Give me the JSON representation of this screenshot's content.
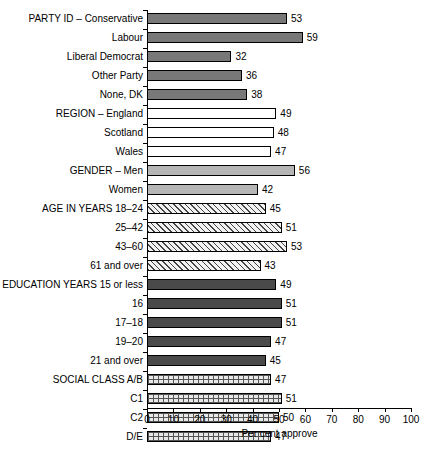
{
  "chart_data": {
    "type": "bar",
    "orientation": "horizontal",
    "title": "",
    "xlabel": "Per cent approve",
    "ylabel": "",
    "xlim": [
      0,
      100
    ],
    "xticks": [
      0,
      10,
      20,
      30,
      40,
      50,
      60,
      70,
      80,
      90,
      100
    ],
    "grid": false,
    "legend": "none",
    "categories": [
      "PARTY ID – Conservative",
      "Labour",
      "Liberal Democrat",
      "Other Party",
      "None, DK",
      "REGION – England",
      "Scotland",
      "Wales",
      "GENDER – Men",
      "Women",
      "AGE IN YEARS 18–24",
      "25–42",
      "43–60",
      "61 and over",
      "EDUCATION YEARS 15 or less",
      "16",
      "17–18",
      "19–20",
      "21 and over",
      "SOCIAL CLASS A/B",
      "C1",
      "C2",
      "D/E"
    ],
    "values": [
      53,
      59,
      32,
      36,
      38,
      49,
      48,
      47,
      56,
      42,
      45,
      51,
      53,
      43,
      49,
      51,
      51,
      47,
      45,
      47,
      51,
      50,
      47
    ],
    "groups": [
      {
        "name": "PARTY ID",
        "fill": "dark",
        "rows": [
          0,
          1,
          2,
          3,
          4
        ]
      },
      {
        "name": "REGION",
        "fill": "white",
        "rows": [
          5,
          6,
          7
        ]
      },
      {
        "name": "GENDER",
        "fill": "light",
        "rows": [
          8,
          9
        ]
      },
      {
        "name": "AGE IN YEARS",
        "fill": "hatch",
        "rows": [
          10,
          11,
          12,
          13
        ]
      },
      {
        "name": "EDUCATION YEARS",
        "fill": "vdark",
        "rows": [
          14,
          15,
          16,
          17,
          18
        ]
      },
      {
        "name": "SOCIAL CLASS",
        "fill": "brick",
        "rows": [
          19,
          20,
          21,
          22
        ]
      }
    ],
    "bars": [
      {
        "label": "PARTY ID – Conservative",
        "value": 53,
        "fill": "dark"
      },
      {
        "label": "Labour",
        "value": 59,
        "fill": "dark"
      },
      {
        "label": "Liberal Democrat",
        "value": 32,
        "fill": "dark"
      },
      {
        "label": "Other Party",
        "value": 36,
        "fill": "dark"
      },
      {
        "label": "None, DK",
        "value": 38,
        "fill": "dark"
      },
      {
        "label": "REGION – England",
        "value": 49,
        "fill": "white"
      },
      {
        "label": "Scotland",
        "value": 48,
        "fill": "white"
      },
      {
        "label": "Wales",
        "value": 47,
        "fill": "white"
      },
      {
        "label": "GENDER – Men",
        "value": 56,
        "fill": "light"
      },
      {
        "label": "Women",
        "value": 42,
        "fill": "light"
      },
      {
        "label": "AGE IN YEARS 18–24",
        "value": 45,
        "fill": "hatch"
      },
      {
        "label": "25–42",
        "value": 51,
        "fill": "hatch"
      },
      {
        "label": "43–60",
        "value": 53,
        "fill": "hatch"
      },
      {
        "label": "61 and over",
        "value": 43,
        "fill": "hatch"
      },
      {
        "label": "EDUCATION YEARS 15 or less",
        "value": 49,
        "fill": "vdark"
      },
      {
        "label": "16",
        "value": 51,
        "fill": "vdark"
      },
      {
        "label": "17–18",
        "value": 51,
        "fill": "vdark"
      },
      {
        "label": "19–20",
        "value": 47,
        "fill": "vdark"
      },
      {
        "label": "21 and over",
        "value": 45,
        "fill": "vdark"
      },
      {
        "label": "SOCIAL CLASS A/B",
        "value": 47,
        "fill": "brick"
      },
      {
        "label": "C1",
        "value": 51,
        "fill": "brick"
      },
      {
        "label": "C2",
        "value": 50,
        "fill": "brick"
      },
      {
        "label": "D/E",
        "value": 47,
        "fill": "brick"
      }
    ]
  },
  "caption": {
    "text": ""
  }
}
